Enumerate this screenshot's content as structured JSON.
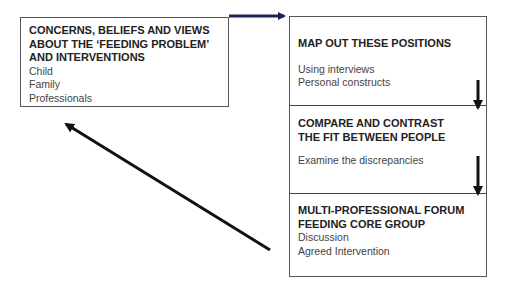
{
  "left_box": {
    "title_lines": [
      "CONCERNS, BELIEFS AND VIEWS",
      "ABOUT THE ‘FEEDING PROBLEM’",
      "AND INTERVENTIONS"
    ],
    "items": [
      "Child",
      "Family",
      "Professionals"
    ]
  },
  "right_box": {
    "sections": [
      {
        "title_lines": [
          "MAP OUT THESE POSITIONS"
        ],
        "items": [
          "Using interviews",
          "Personal constructs"
        ]
      },
      {
        "title_lines": [
          "COMPARE AND CONTRAST",
          "THE FIT BETWEEN PEOPLE"
        ],
        "items": [
          "Examine the discrepancies"
        ]
      },
      {
        "title_lines": [
          "MULTI-PROFESSIONAL FORUM",
          "FEEDING CORE GROUP"
        ],
        "items": [
          "Discussion",
          "Agreed Intervention"
        ]
      }
    ]
  },
  "arrows": [
    {
      "from": "left_box",
      "to": "right_box.sections.0",
      "color": "#1a2255"
    },
    {
      "from": "right_box.sections.0",
      "to": "right_box.sections.1",
      "color": "#111111"
    },
    {
      "from": "right_box.sections.1",
      "to": "right_box.sections.2",
      "color": "#111111"
    },
    {
      "from": "right_box.sections.2",
      "to": "left_box",
      "color": "#111111"
    }
  ]
}
